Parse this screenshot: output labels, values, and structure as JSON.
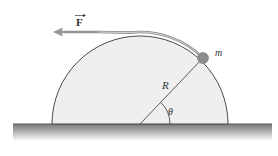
{
  "diagram": {
    "labels": {
      "force": "F",
      "mass": "m",
      "radius": "R",
      "angle": "θ"
    },
    "colors": {
      "background": "#ffffff",
      "half_cylinder_fill": "#efefef",
      "outline": "#4a4a4a",
      "mass": "#8c8c8c",
      "rope_arrow": "#8f8f8f",
      "ground_top": "#7d7d7d",
      "ground_bottom": "#ffffff"
    }
  }
}
